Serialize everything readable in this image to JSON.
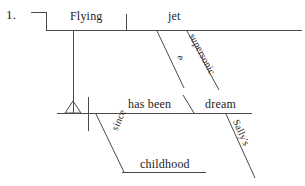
{
  "page": {
    "background_color": "#ffffff",
    "ink_color": "#4a4a4a",
    "text_color": "#1c1c1c"
  },
  "exercise": {
    "item_number": "1.",
    "sentence": "Flying a supersonic jet has been Sally's dream since childhood."
  },
  "diagram": {
    "type": "reed-kellogg-sentence-diagram",
    "main_clause": {
      "subject": "Flying",
      "verb": "has been",
      "predicate_nominative": "dream"
    },
    "subject_phrase_modifiers": [
      {
        "word": "a",
        "attaches_to": "jet",
        "slant": "left"
      },
      {
        "word": "supersonic",
        "attaches_to": "jet",
        "slant": "right"
      }
    ],
    "subject_object": "jet",
    "predicate_modifiers": [
      {
        "word": "Sally's",
        "attaches_to": "dream"
      }
    ],
    "prepositional_phrase": {
      "preposition": "since",
      "object": "childhood",
      "attaches_to": "has been"
    }
  },
  "labels": {
    "item_number": "1.",
    "flying": "Flying",
    "jet": "jet",
    "a": "a",
    "supersonic": "supersonic",
    "has_been": "has been",
    "dream": "dream",
    "sallys": "Sally's",
    "since": "since",
    "childhood": "childhood"
  }
}
